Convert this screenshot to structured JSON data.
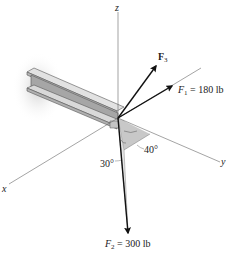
{
  "diagram": {
    "axes": {
      "x_label": "x",
      "y_label": "y",
      "z_label": "z"
    },
    "forces": [
      {
        "id": "F1",
        "symbol": "F",
        "subscript": "1",
        "equation": " = 180 lb",
        "magnitude": 180,
        "unit": "lb"
      },
      {
        "id": "F2",
        "symbol": "F",
        "subscript": "2",
        "equation": " = 300 lb",
        "magnitude": 300,
        "unit": "lb"
      },
      {
        "id": "F3",
        "symbol": "F",
        "subscript": "3",
        "equation": "",
        "magnitude": null,
        "unit": ""
      }
    ],
    "angles": [
      {
        "label": "30°",
        "value": 30
      },
      {
        "label": "40°",
        "value": 40
      }
    ],
    "colors": {
      "axis": "#555555",
      "arrow": "#111111",
      "beam_top": "#d8d8d8",
      "beam_web": "#a8a8a8",
      "beam_shadow": "#cfcfcf",
      "angle_plane": "#c8c8c8"
    }
  }
}
